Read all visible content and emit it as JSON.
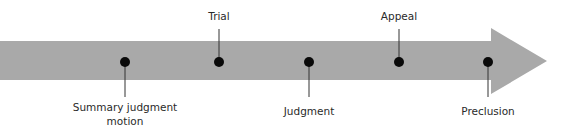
{
  "diagram": {
    "type": "timeline-arrow",
    "colors": {
      "arrow": "#a9a9a9",
      "dot": "#0a0a0a",
      "line": "#333333",
      "text": "#2a2a2a"
    },
    "milestones": [
      {
        "label": "Summary judgment",
        "label2": "motion",
        "x": 125,
        "position": "below"
      },
      {
        "label": "Trial",
        "x": 219,
        "position": "above"
      },
      {
        "label": "Judgment",
        "x": 309,
        "position": "below"
      },
      {
        "label": "Appeal",
        "x": 399,
        "position": "above"
      },
      {
        "label": "Preclusion",
        "x": 488,
        "position": "below"
      }
    ]
  }
}
